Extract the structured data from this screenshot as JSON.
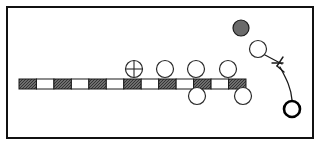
{
  "figure": {
    "background_color": "#ffffff",
    "stroke_color": "#1a1a1a",
    "frame": {
      "label": "outer-frame",
      "x": 7,
      "y": 7,
      "width": 306,
      "height": 131,
      "stroke": "#111111",
      "stroke_width": 2,
      "fill": "none"
    },
    "bar": {
      "label": "segmented-bar",
      "x": 19,
      "y": 79,
      "width": 227,
      "height": 10,
      "stroke": "#1a1a1a",
      "stroke_width": 1,
      "dark_fill": "#6e6e6e",
      "light_fill": "#ffffff",
      "segment_count": 13,
      "segment_width": 17.46,
      "segments": [
        {
          "index": 0,
          "type": "dark"
        },
        {
          "index": 1,
          "type": "light"
        },
        {
          "index": 2,
          "type": "dark"
        },
        {
          "index": 3,
          "type": "light"
        },
        {
          "index": 4,
          "type": "dark"
        },
        {
          "index": 5,
          "type": "light"
        },
        {
          "index": 6,
          "type": "dark"
        },
        {
          "index": 7,
          "type": "light"
        },
        {
          "index": 8,
          "type": "dark"
        },
        {
          "index": 9,
          "type": "light"
        },
        {
          "index": 10,
          "type": "dark"
        },
        {
          "index": 11,
          "type": "light"
        },
        {
          "index": 12,
          "type": "dark"
        }
      ]
    },
    "circles": [
      {
        "name": "crossed-circle-marker",
        "kind": "crossed",
        "cx": 134,
        "cy": 69,
        "r": 8.5,
        "fill": "#ffffff",
        "stroke": "#2a2a2a",
        "stroke_width": 1.2
      },
      {
        "name": "open-circle-above-1",
        "kind": "open",
        "cx": 165,
        "cy": 69,
        "r": 8.5,
        "fill": "#ffffff",
        "stroke": "#2a2a2a",
        "stroke_width": 1.2
      },
      {
        "name": "open-circle-above-2",
        "kind": "open",
        "cx": 196,
        "cy": 69,
        "r": 8.5,
        "fill": "#ffffff",
        "stroke": "#2a2a2a",
        "stroke_width": 1.2
      },
      {
        "name": "open-circle-above-3",
        "kind": "open",
        "cx": 228,
        "cy": 69,
        "r": 8.5,
        "fill": "#ffffff",
        "stroke": "#2a2a2a",
        "stroke_width": 1.2
      },
      {
        "name": "open-circle-below-1",
        "kind": "open",
        "cx": 197,
        "cy": 96,
        "r": 8.5,
        "fill": "#ffffff",
        "stroke": "#2a2a2a",
        "stroke_width": 1.2
      },
      {
        "name": "open-circle-below-2",
        "kind": "open",
        "cx": 243,
        "cy": 96,
        "r": 8.5,
        "fill": "#ffffff",
        "stroke": "#2a2a2a",
        "stroke_width": 1.2
      },
      {
        "name": "gray-filled-circle",
        "kind": "filled",
        "cx": 241,
        "cy": 28,
        "r": 8.0,
        "fill": "#6b6b6b",
        "stroke": "#1a1a1a",
        "stroke_width": 1.2
      },
      {
        "name": "open-circle-upper-right",
        "kind": "open",
        "cx": 258,
        "cy": 49,
        "r": 8.5,
        "fill": "#ffffff",
        "stroke": "#2a2a2a",
        "stroke_width": 1.2
      },
      {
        "name": "thick-ring-circle",
        "kind": "thick-ring",
        "cx": 292,
        "cy": 109,
        "r": 8.0,
        "fill": "#ffffff",
        "stroke": "#000000",
        "stroke_width": 2.6
      }
    ],
    "connectors": [
      {
        "name": "leader-line-segment",
        "kind": "line",
        "x1": 265,
        "y1": 55,
        "x2": 282,
        "y2": 64,
        "stroke": "#1a1a1a",
        "stroke_width": 1.2
      },
      {
        "name": "pointer-barb-left",
        "kind": "line",
        "x1": 272,
        "y1": 63,
        "x2": 283,
        "y2": 63,
        "stroke": "#1a1a1a",
        "stroke_width": 1.4
      },
      {
        "name": "pointer-barb-upper",
        "kind": "line",
        "x1": 283,
        "y1": 57,
        "x2": 277,
        "y2": 66,
        "stroke": "#1a1a1a",
        "stroke_width": 1.4
      },
      {
        "name": "pointer-barb-lower",
        "kind": "line",
        "x1": 277,
        "y1": 66,
        "x2": 284,
        "y2": 72,
        "stroke": "#1a1a1a",
        "stroke_width": 1.4
      },
      {
        "name": "curved-tether",
        "kind": "path",
        "d": "M 280 67 C 287 80, 291 88, 292 100",
        "stroke": "#1a1a1a",
        "stroke_width": 1.3
      }
    ],
    "crossed_circle_ticks": {
      "name": "crossed-circle-crosshair",
      "horizontal": {
        "x1": -8.5,
        "y1": 0,
        "x2": 8.5,
        "y2": 0
      },
      "vertical": {
        "x1": 0,
        "y1": -8.5,
        "x2": 0,
        "y2": 8.5
      },
      "stroke": "#2a2a2a",
      "stroke_width": 1.1
    }
  }
}
